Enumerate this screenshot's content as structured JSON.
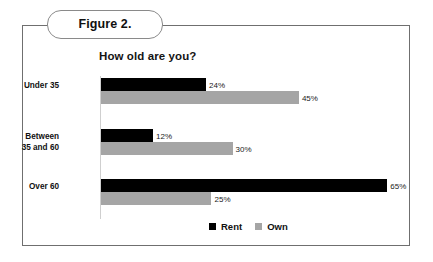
{
  "figure": {
    "label": "Figure 2."
  },
  "chart_data": {
    "type": "bar",
    "orientation": "horizontal",
    "title": "How old are you?",
    "xlabel": "",
    "ylabel": "",
    "xlim": [
      0,
      70
    ],
    "grid": false,
    "legend_position": "bottom-right",
    "categories": [
      "Under 35",
      "Between 35 and 60",
      "Over 60"
    ],
    "category_lines": [
      [
        "Under 35"
      ],
      [
        "Between",
        "35 and 60"
      ],
      [
        "Over 60"
      ]
    ],
    "series": [
      {
        "name": "Rent",
        "color": "#000000",
        "values": [
          24,
          12,
          65
        ],
        "labels": [
          "24%",
          "12%",
          "65%"
        ]
      },
      {
        "name": "Own",
        "color": "#a5a5a5",
        "values": [
          45,
          30,
          25
        ],
        "labels": [
          "45%",
          "30%",
          "25%"
        ]
      }
    ]
  },
  "colors": {
    "rent": "#000000",
    "own": "#a5a5a5",
    "frame_border": "#6f6f6f",
    "pill_border": "#8a8a8a",
    "axis": "#cfcfcf",
    "text": "#111111",
    "background": "#ffffff"
  }
}
